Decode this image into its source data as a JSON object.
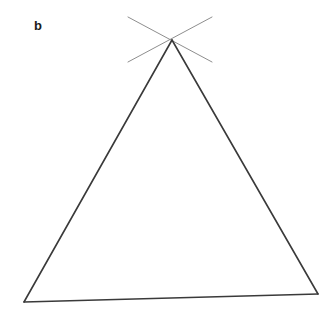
{
  "figure": {
    "panel_label": "b",
    "background_color": "#ffffff",
    "width": 330,
    "height": 319
  },
  "chart_data": {
    "type": "line",
    "title": "b",
    "xlabel": "",
    "ylabel": "",
    "xlim": [
      0,
      330
    ],
    "ylim": [
      0,
      319
    ],
    "grid": false,
    "legend": null,
    "annotations": [
      {
        "text": "b",
        "x": 38,
        "y": 27,
        "bold": true
      }
    ],
    "series": [
      {
        "name": "triangle-left-side",
        "stroke": "#3a3a3a",
        "width": 1.6,
        "points": [
          [
            172,
            40
          ],
          [
            24,
            302
          ]
        ]
      },
      {
        "name": "triangle-right-side",
        "stroke": "#3a3a3a",
        "width": 1.6,
        "points": [
          [
            172,
            40
          ],
          [
            318,
            294
          ]
        ]
      },
      {
        "name": "triangle-base",
        "stroke": "#3a3a3a",
        "width": 1.6,
        "points": [
          [
            24,
            302
          ],
          [
            318,
            294
          ]
        ]
      },
      {
        "name": "construction-line-upper-left-to-lower-right",
        "stroke": "#8e8e8e",
        "width": 1.0,
        "points": [
          [
            128,
            17
          ],
          [
            212,
            62
          ]
        ]
      },
      {
        "name": "construction-line-upper-right-to-lower-left",
        "stroke": "#8e8e8e",
        "width": 1.0,
        "points": [
          [
            212,
            17
          ],
          [
            128,
            62
          ]
        ]
      }
    ],
    "vertices": {
      "apex": [
        172,
        40
      ],
      "bottom_left": [
        24,
        302
      ],
      "bottom_right": [
        318,
        294
      ],
      "crossing_point": [
        172,
        40
      ]
    }
  }
}
